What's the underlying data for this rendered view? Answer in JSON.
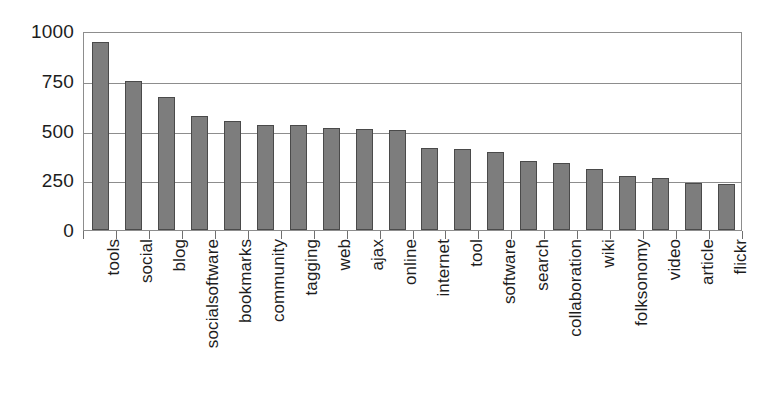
{
  "chart_data": {
    "type": "bar",
    "title": "",
    "subtitle": "",
    "xlabel": "",
    "ylabel": "",
    "ylim": [
      0,
      1000
    ],
    "yticks": [
      0,
      250,
      500,
      750,
      1000
    ],
    "ytick_labels": [
      "0",
      "250",
      "500",
      "750",
      "1000"
    ],
    "grid": true,
    "legend": false,
    "legend_position": "none",
    "orientation": "vertical",
    "xtick_label_rotation": 90,
    "bar_fill_color": "#7d7d7d",
    "bar_edge_color": "#4a4a4a",
    "axis_color": "#8d8d8d",
    "background_color": "#ffffff",
    "categories": [
      "tools",
      "social",
      "blog",
      "socialsoftware",
      "bookmarks",
      "community",
      "tagging",
      "web",
      "ajax",
      "online",
      "internet",
      "tool",
      "software",
      "search",
      "collaboration",
      "wiki",
      "folksonomy",
      "video",
      "article",
      "flickr"
    ],
    "values": [
      945,
      750,
      670,
      575,
      550,
      528,
      527,
      512,
      510,
      503,
      410,
      405,
      390,
      345,
      337,
      308,
      270,
      260,
      237,
      233
    ]
  }
}
